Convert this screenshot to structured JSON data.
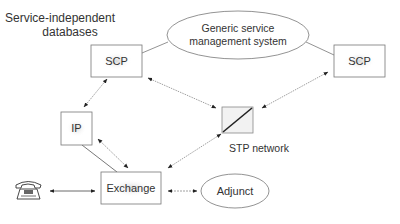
{
  "diagram": {
    "title_line1": "Service-independent",
    "title_line2": "databases",
    "nodes": {
      "gsms_line1": "Generic service",
      "gsms_line2": "management system",
      "scp_left": "SCP",
      "scp_right": "SCP",
      "ip": "IP",
      "stp_label": "STP network",
      "exchange": "Exchange",
      "adjunct": "Adjunct"
    },
    "icons": {
      "telephone": "telephone-icon",
      "stp": "stp-network-icon"
    },
    "colors": {
      "stroke": "#777777",
      "box_fill": "#ffffff",
      "text": "#333333",
      "arrow": "#222222"
    }
  }
}
